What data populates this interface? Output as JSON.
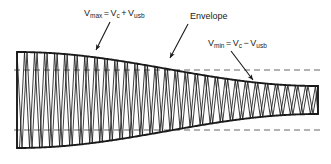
{
  "figure": {
    "background_color": "#ffffff",
    "stroke_color": "#1a1a1a",
    "dash_color": "#555555",
    "width": 331,
    "height": 164
  },
  "labels": {
    "vmax": {
      "text": "Vmax = Vc + Vusb",
      "var1": "V",
      "sub1": "max",
      "eq": "=",
      "var2": "V",
      "sub2": "c",
      "op": "+",
      "var3": "V",
      "sub3": "usb"
    },
    "envelope": {
      "text": "Envelope"
    },
    "vmin": {
      "text": "Vmin = Vc − Vusb",
      "var1": "V",
      "sub1": "min",
      "eq": "=",
      "var2": "V",
      "sub2": "c",
      "op": "−",
      "var3": "V",
      "sub3": "usb"
    }
  },
  "chart_data": {
    "type": "line",
    "xlabel": "",
    "ylabel": "",
    "grid": false,
    "legend": "none",
    "xlim": [
      17,
      318
    ],
    "ylim": [
      52,
      148
    ],
    "baseline_y": 100,
    "carrier_cycles": 30,
    "envelope": {
      "description": "Envelope amplitude tapers from maximum on the left to minimum on the right",
      "amplitude_max": 48,
      "amplitude_min": 14,
      "top_peak_y": 52,
      "bottom_trough_y": 148,
      "top_at_left_y": 70,
      "bottom_at_left_y": 130,
      "top_at_right_y": 70,
      "bottom_at_right_y": 130
    },
    "reference_lines": [
      {
        "name": "upper-dashed",
        "y": 70,
        "style": "dashed"
      },
      {
        "name": "lower-dashed",
        "y": 130,
        "style": "dashed"
      }
    ],
    "annotations": [
      {
        "name": "vmax",
        "text": "Vmax = Vc + Vusb",
        "points_to": [
          95,
          52
        ]
      },
      {
        "name": "envelope",
        "text": "Envelope",
        "points_to": [
          168,
          60
        ]
      },
      {
        "name": "vmin",
        "text": "Vmin = Vc − Vusb",
        "points_to": [
          253,
          82
        ]
      }
    ]
  }
}
